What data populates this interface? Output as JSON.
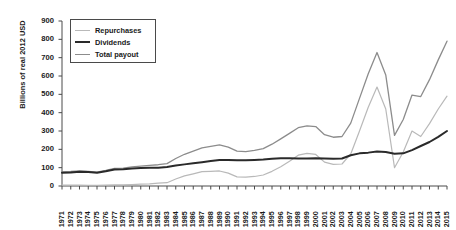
{
  "chart_data": {
    "type": "line",
    "title": "",
    "xlabel": "",
    "ylabel": "Billions of real 2012 USD",
    "ylim": [
      0,
      900
    ],
    "yticks": [
      0,
      100,
      200,
      300,
      400,
      500,
      600,
      700,
      800,
      900
    ],
    "grid": false,
    "legend_position": "top-left",
    "categories": [
      "1971",
      "1972",
      "1973",
      "1974",
      "1975",
      "1976",
      "1977",
      "1978",
      "1979",
      "1980",
      "1981",
      "1982",
      "1983",
      "1984",
      "1985",
      "1986",
      "1987",
      "1988",
      "1989",
      "1990",
      "1991",
      "1992",
      "1993",
      "1994",
      "1995",
      "1996",
      "1997",
      "1998",
      "1999",
      "2000",
      "2001",
      "2002",
      "2003",
      "2004",
      "2005",
      "2006",
      "2007",
      "2008",
      "2009",
      "2010",
      "2011",
      "2012",
      "2013",
      "2014",
      "2015"
    ],
    "series": [
      {
        "name": "Repurchases",
        "color": "#b9b9b9",
        "width": 1.2,
        "values": [
          5,
          5,
          5,
          4,
          4,
          5,
          6,
          6,
          8,
          10,
          12,
          16,
          18,
          38,
          55,
          66,
          78,
          80,
          82,
          70,
          50,
          48,
          52,
          60,
          80,
          105,
          135,
          168,
          178,
          172,
          130,
          118,
          120,
          175,
          300,
          430,
          540,
          420,
          100,
          185,
          300,
          270,
          340,
          420,
          490
        ]
      },
      {
        "name": "Dividends",
        "color": "#2a2a2a",
        "width": 2.0,
        "values": [
          72,
          74,
          78,
          76,
          72,
          80,
          90,
          92,
          96,
          98,
          100,
          100,
          104,
          112,
          118,
          124,
          130,
          136,
          142,
          142,
          140,
          140,
          142,
          144,
          148,
          152,
          152,
          150,
          150,
          152,
          150,
          148,
          150,
          168,
          178,
          182,
          188,
          186,
          176,
          178,
          196,
          218,
          240,
          268,
          300
        ]
      },
      {
        "name": "Total payout",
        "color": "#8c8c8c",
        "width": 1.3,
        "values": [
          77,
          79,
          83,
          80,
          76,
          85,
          96,
          98,
          104,
          108,
          112,
          116,
          122,
          150,
          173,
          190,
          208,
          216,
          224,
          212,
          190,
          188,
          194,
          204,
          228,
          257,
          287,
          318,
          328,
          324,
          280,
          266,
          270,
          343,
          478,
          612,
          728,
          606,
          276,
          363,
          496,
          488,
          580,
          688,
          790
        ]
      }
    ]
  },
  "legend": {
    "items": [
      {
        "label": "Repurchases"
      },
      {
        "label": "Dividends"
      },
      {
        "label": "Total payout"
      }
    ]
  }
}
